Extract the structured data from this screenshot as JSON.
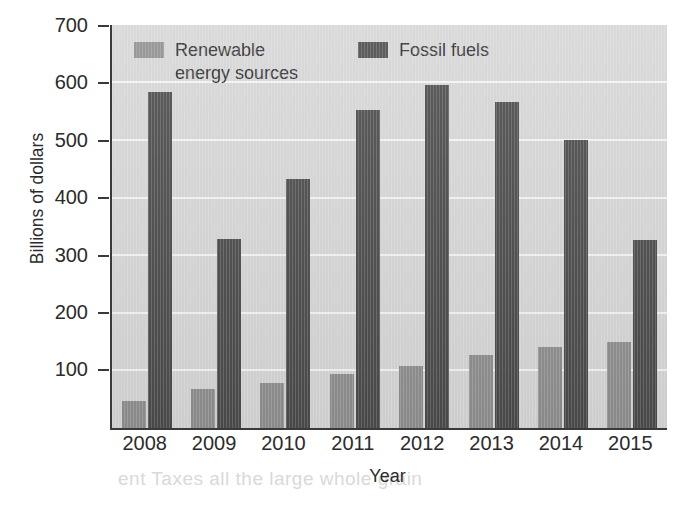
{
  "chart_data": {
    "type": "bar",
    "title": "",
    "xlabel": "Year",
    "ylabel": "Billions of dollars",
    "categories": [
      "2008",
      "2009",
      "2010",
      "2011",
      "2012",
      "2013",
      "2014",
      "2015"
    ],
    "series": [
      {
        "name": "Renewable\nenergy sources",
        "legend_label": "Renewable energy sources",
        "color": "#8e8e8e",
        "values": [
          47,
          67,
          79,
          94,
          107,
          126,
          141,
          150
        ]
      },
      {
        "name": "Fossil fuels",
        "legend_label": "Fossil fuels",
        "color": "#4b4b4b",
        "values": [
          583,
          329,
          433,
          553,
          595,
          567,
          501,
          327
        ]
      }
    ],
    "ylim": [
      0,
      700
    ],
    "yticks": [
      100,
      200,
      300,
      400,
      500,
      600,
      700
    ],
    "ytick_labels": [
      "100",
      "200",
      "300",
      "400",
      "500",
      "600",
      "700"
    ],
    "grid": true,
    "grid_axis": "y",
    "legend_position": "top-left-inside",
    "plot_background": "#d5d5d5",
    "gridline_color": "#f3f3f3",
    "axis_color": "#3a3a3a"
  },
  "legend": {
    "items": [
      {
        "label": "Renewable\nenergy sources",
        "color": "#8e8e8e"
      },
      {
        "label": "Fossil fuels",
        "color": "#4b4b4b"
      }
    ]
  },
  "axes": {
    "y_title": "Billions of dollars",
    "x_title": "Year"
  },
  "page_bleed": {
    "line_top": "he exchange rate for dollars",
    "line_bottom": "ent Taxes all the large whole grain"
  }
}
